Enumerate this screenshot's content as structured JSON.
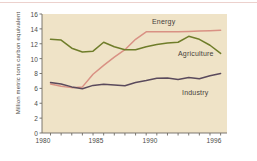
{
  "chart_data": {
    "type": "line",
    "title": "",
    "xlabel": "",
    "ylabel": "Million metric tons carbon equivalent",
    "xlim": [
      1979.2,
      1996.6
    ],
    "ylim": [
      0,
      16
    ],
    "yticks": [
      0,
      2,
      4,
      6,
      8,
      10,
      12,
      14,
      16
    ],
    "ytick_labels": [
      "0",
      "2",
      "4",
      "6",
      "8",
      "10",
      "12",
      "14",
      "16"
    ],
    "xticks": [
      1980,
      1981,
      1982,
      1983,
      1984,
      1985,
      1986,
      1987,
      1988,
      1989,
      1990,
      1991,
      1992,
      1993,
      1994,
      1995,
      1996
    ],
    "xtick_labels_shown": [
      "1980",
      "1985",
      "1990",
      "1996"
    ],
    "xtick_labels_shown_at": [
      1980,
      1985,
      1990,
      1996
    ],
    "grid": false,
    "legend": "inline-labels",
    "plot_background": "#efe3c7",
    "page_background": "#ffffff",
    "x": [
      1980,
      1981,
      1982,
      1983,
      1984,
      1985,
      1986,
      1987,
      1988,
      1989,
      1990,
      1991,
      1992,
      1993,
      1994,
      1995,
      1996
    ],
    "series": [
      {
        "name": "Energy",
        "color": "#d99184",
        "values": [
          6.6,
          6.3,
          6.1,
          6.2,
          7.9,
          9.1,
          10.2,
          11.2,
          12.6,
          13.6,
          13.6,
          13.6,
          13.6,
          13.65,
          13.7,
          13.75,
          13.8
        ]
      },
      {
        "name": "Agriculture",
        "color": "#6f7d2a",
        "values": [
          12.6,
          12.5,
          11.4,
          10.9,
          11.0,
          12.2,
          11.6,
          11.2,
          11.2,
          11.6,
          11.9,
          12.1,
          12.2,
          13.0,
          12.6,
          11.8,
          10.7
        ]
      },
      {
        "name": "Industry",
        "color": "#5a4a5c",
        "values": [
          6.8,
          6.6,
          6.2,
          5.95,
          6.4,
          6.55,
          6.45,
          6.35,
          6.8,
          7.05,
          7.35,
          7.4,
          7.2,
          7.45,
          7.3,
          7.7,
          8.0
        ]
      }
    ],
    "annotations": [
      {
        "text": "Energy",
        "x": 1990.5,
        "y": 14.9
      },
      {
        "text": "Agriculture",
        "x": 1993.0,
        "y": 10.6
      },
      {
        "text": "Industry",
        "x": 1993.3,
        "y": 5.6
      }
    ]
  },
  "axes": {
    "y_axis_title": "Million metric tons carbon equivalent",
    "y_tick_0": "0",
    "y_tick_2": "2",
    "y_tick_4": "4",
    "y_tick_6": "6",
    "y_tick_8": "8",
    "y_tick_10": "10",
    "y_tick_12": "12",
    "y_tick_14": "14",
    "y_tick_16": "16",
    "x_tick_1980": "1980",
    "x_tick_1985": "1985",
    "x_tick_1990": "1990",
    "x_tick_1996": "1996"
  },
  "labels": {
    "energy": "Energy",
    "agriculture": "Agriculture",
    "industry": "Industry"
  }
}
